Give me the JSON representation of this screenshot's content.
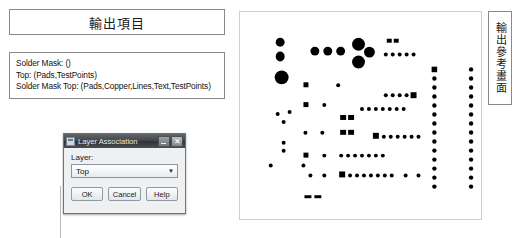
{
  "left": {
    "title": "輸出項目",
    "output_items": [
      "Solder Mask: ()",
      "Top: (Pads,TestPoints)",
      "Solder Mask Top: (Pads,Copper,Lines,Text,TestPoints)"
    ]
  },
  "dialog": {
    "title": "Layer Association",
    "layer_label": "Layer:",
    "layer_value": "Top",
    "dropdown_arrow": "▼",
    "minimize_label": "–",
    "close_label": "✕",
    "buttons": [
      {
        "label": "OK",
        "name": "ok-button"
      },
      {
        "label": "Cancel",
        "name": "cancel-button"
      },
      {
        "label": "Help",
        "name": "help-button"
      }
    ]
  },
  "preview": {
    "caption": "輸出參考畫面",
    "pad_color": "#000000",
    "background": "#ffffff",
    "border_color": "#cfcfcf",
    "pads": [
      {
        "shape": "circle",
        "x": 36,
        "y": 26,
        "w": 9,
        "h": 9
      },
      {
        "shape": "circle",
        "x": 36,
        "y": 40,
        "w": 9,
        "h": 10
      },
      {
        "shape": "circle",
        "x": 35,
        "y": 59,
        "w": 14,
        "h": 14
      },
      {
        "shape": "circle",
        "x": 71,
        "y": 35,
        "w": 9,
        "h": 9
      },
      {
        "shape": "circle",
        "x": 84,
        "y": 35,
        "w": 9,
        "h": 9
      },
      {
        "shape": "circle",
        "x": 97,
        "y": 35,
        "w": 9,
        "h": 9
      },
      {
        "shape": "circle",
        "x": 113,
        "y": 26,
        "w": 13,
        "h": 13
      },
      {
        "shape": "circle",
        "x": 125,
        "y": 35,
        "w": 11,
        "h": 11
      },
      {
        "shape": "circle",
        "x": 113,
        "y": 44,
        "w": 13,
        "h": 13
      },
      {
        "shape": "rect",
        "x": 148,
        "y": 27,
        "w": 5,
        "h": 4
      },
      {
        "shape": "rect",
        "x": 155,
        "y": 27,
        "w": 5,
        "h": 4
      },
      {
        "shape": "circle",
        "x": 145,
        "y": 41,
        "w": 4,
        "h": 4
      },
      {
        "shape": "circle",
        "x": 152,
        "y": 41,
        "w": 4,
        "h": 4
      },
      {
        "shape": "circle",
        "x": 159,
        "y": 41,
        "w": 4,
        "h": 4
      },
      {
        "shape": "circle",
        "x": 166,
        "y": 41,
        "w": 4,
        "h": 4
      },
      {
        "shape": "circle",
        "x": 173,
        "y": 41,
        "w": 4,
        "h": 4
      },
      {
        "shape": "rect",
        "x": 64,
        "y": 71,
        "w": 5,
        "h": 5
      },
      {
        "shape": "circle",
        "x": 97,
        "y": 72,
        "w": 4,
        "h": 4
      },
      {
        "shape": "circle",
        "x": 145,
        "y": 82,
        "w": 4,
        "h": 4
      },
      {
        "shape": "circle",
        "x": 152,
        "y": 82,
        "w": 4,
        "h": 4
      },
      {
        "shape": "circle",
        "x": 159,
        "y": 82,
        "w": 4,
        "h": 4
      },
      {
        "shape": "circle",
        "x": 166,
        "y": 82,
        "w": 4,
        "h": 4
      },
      {
        "shape": "rect",
        "x": 172,
        "y": 81,
        "w": 6,
        "h": 6
      },
      {
        "shape": "rect",
        "x": 64,
        "y": 91,
        "w": 5,
        "h": 5
      },
      {
        "shape": "circle",
        "x": 83,
        "y": 92,
        "w": 4,
        "h": 4
      },
      {
        "shape": "circle",
        "x": 36,
        "y": 101,
        "w": 4,
        "h": 4
      },
      {
        "shape": "circle",
        "x": 48,
        "y": 99,
        "w": 4,
        "h": 4
      },
      {
        "shape": "circle",
        "x": 42,
        "y": 109,
        "w": 4,
        "h": 4
      },
      {
        "shape": "circle",
        "x": 121,
        "y": 96,
        "w": 4,
        "h": 4
      },
      {
        "shape": "circle",
        "x": 128,
        "y": 96,
        "w": 4,
        "h": 4
      },
      {
        "shape": "circle",
        "x": 135,
        "y": 96,
        "w": 4,
        "h": 4
      },
      {
        "shape": "circle",
        "x": 142,
        "y": 96,
        "w": 4,
        "h": 4
      },
      {
        "shape": "circle",
        "x": 149,
        "y": 96,
        "w": 4,
        "h": 4
      },
      {
        "shape": "circle",
        "x": 156,
        "y": 96,
        "w": 4,
        "h": 4
      },
      {
        "shape": "circle",
        "x": 163,
        "y": 96,
        "w": 4,
        "h": 4
      },
      {
        "shape": "rect",
        "x": 101,
        "y": 104,
        "w": 6,
        "h": 5
      },
      {
        "shape": "rect",
        "x": 109,
        "y": 104,
        "w": 6,
        "h": 5
      },
      {
        "shape": "rect",
        "x": 101,
        "y": 119,
        "w": 6,
        "h": 5
      },
      {
        "shape": "rect",
        "x": 109,
        "y": 119,
        "w": 6,
        "h": 5
      },
      {
        "shape": "circle",
        "x": 64,
        "y": 120,
        "w": 4,
        "h": 4
      },
      {
        "shape": "circle",
        "x": 81,
        "y": 120,
        "w": 4,
        "h": 4
      },
      {
        "shape": "rect",
        "x": 134,
        "y": 122,
        "w": 6,
        "h": 6
      },
      {
        "shape": "circle",
        "x": 143,
        "y": 124,
        "w": 4,
        "h": 4
      },
      {
        "shape": "circle",
        "x": 150,
        "y": 124,
        "w": 4,
        "h": 4
      },
      {
        "shape": "circle",
        "x": 157,
        "y": 124,
        "w": 4,
        "h": 4
      },
      {
        "shape": "circle",
        "x": 164,
        "y": 124,
        "w": 4,
        "h": 4
      },
      {
        "shape": "circle",
        "x": 171,
        "y": 124,
        "w": 4,
        "h": 4
      },
      {
        "shape": "circle",
        "x": 178,
        "y": 124,
        "w": 4,
        "h": 4
      },
      {
        "shape": "circle",
        "x": 42,
        "y": 130,
        "w": 4,
        "h": 4
      },
      {
        "shape": "circle",
        "x": 42,
        "y": 138,
        "w": 4,
        "h": 4
      },
      {
        "shape": "rect",
        "x": 64,
        "y": 142,
        "w": 5,
        "h": 5
      },
      {
        "shape": "circle",
        "x": 83,
        "y": 143,
        "w": 4,
        "h": 4
      },
      {
        "shape": "circle",
        "x": 100,
        "y": 143,
        "w": 4,
        "h": 4
      },
      {
        "shape": "circle",
        "x": 107,
        "y": 143,
        "w": 4,
        "h": 4
      },
      {
        "shape": "circle",
        "x": 114,
        "y": 143,
        "w": 4,
        "h": 4
      },
      {
        "shape": "circle",
        "x": 121,
        "y": 143,
        "w": 4,
        "h": 4
      },
      {
        "shape": "circle",
        "x": 128,
        "y": 143,
        "w": 4,
        "h": 4
      },
      {
        "shape": "circle",
        "x": 135,
        "y": 143,
        "w": 4,
        "h": 4
      },
      {
        "shape": "circle",
        "x": 142,
        "y": 143,
        "w": 4,
        "h": 4
      },
      {
        "shape": "circle",
        "x": 29,
        "y": 153,
        "w": 4,
        "h": 4
      },
      {
        "shape": "circle",
        "x": 62,
        "y": 153,
        "w": 4,
        "h": 4
      },
      {
        "shape": "circle",
        "x": 69,
        "y": 163,
        "w": 4,
        "h": 4
      },
      {
        "shape": "circle",
        "x": 83,
        "y": 163,
        "w": 4,
        "h": 4
      },
      {
        "shape": "rect",
        "x": 100,
        "y": 161,
        "w": 6,
        "h": 6
      },
      {
        "shape": "circle",
        "x": 109,
        "y": 163,
        "w": 4,
        "h": 4
      },
      {
        "shape": "circle",
        "x": 116,
        "y": 163,
        "w": 4,
        "h": 4
      },
      {
        "shape": "circle",
        "x": 123,
        "y": 163,
        "w": 4,
        "h": 4
      },
      {
        "shape": "circle",
        "x": 130,
        "y": 163,
        "w": 4,
        "h": 4
      },
      {
        "shape": "circle",
        "x": 137,
        "y": 163,
        "w": 4,
        "h": 4
      },
      {
        "shape": "circle",
        "x": 144,
        "y": 163,
        "w": 4,
        "h": 4
      },
      {
        "shape": "circle",
        "x": 151,
        "y": 163,
        "w": 4,
        "h": 4
      },
      {
        "shape": "circle",
        "x": 165,
        "y": 163,
        "w": 4,
        "h": 4
      },
      {
        "shape": "circle",
        "x": 178,
        "y": 163,
        "w": 4,
        "h": 4
      },
      {
        "shape": "rect",
        "x": 65,
        "y": 185,
        "w": 7,
        "h": 3
      },
      {
        "shape": "rect",
        "x": 75,
        "y": 185,
        "w": 7,
        "h": 3
      }
    ],
    "pad_columns": [
      {
        "x": 196,
        "y_start": 58,
        "y_end": 185,
        "step": 9.1,
        "dot": 4.4,
        "head_shape": "rect"
      },
      {
        "x": 233,
        "y_start": 58,
        "y_end": 180,
        "step": 9.1,
        "dot": 4.4,
        "head_shape": "circle"
      }
    ]
  }
}
